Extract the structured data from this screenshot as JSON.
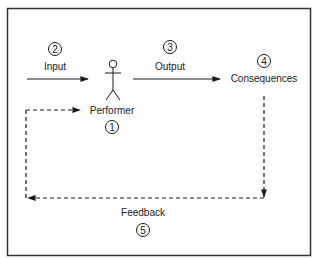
{
  "diagram": {
    "type": "feedback-loop",
    "nodes": {
      "input": {
        "label": "Input",
        "number": "2"
      },
      "performer": {
        "label": "Performer",
        "number": "1"
      },
      "output": {
        "label": "Output",
        "number": "3"
      },
      "consequences": {
        "label": "Consequences",
        "number": "4"
      },
      "feedback": {
        "label": "Feedback",
        "number": "5"
      }
    },
    "edges": [
      {
        "from": "input",
        "to": "performer",
        "style": "solid"
      },
      {
        "from": "performer",
        "to": "consequences",
        "label": "Output",
        "style": "solid"
      },
      {
        "from": "consequences",
        "to": "performer",
        "label": "Feedback",
        "style": "dashed"
      }
    ],
    "colors": {
      "stroke": "#1a1a1a",
      "border": "#333333",
      "background": "#ffffff"
    }
  }
}
